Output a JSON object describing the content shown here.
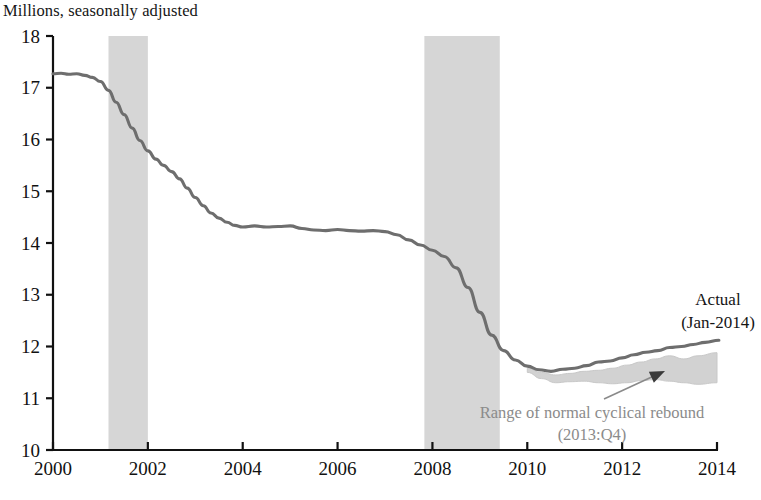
{
  "chart_data": {
    "type": "line",
    "title": "Millions, seasonally adjusted",
    "xlabel": "",
    "ylabel": "",
    "xlim": [
      2000.0,
      2014.0
    ],
    "ylim": [
      10,
      18
    ],
    "grid": false,
    "legend": "none",
    "y_ticks": [
      "18",
      "17",
      "16",
      "15",
      "14",
      "13",
      "12",
      "11",
      "10"
    ],
    "y_tick_values": [
      18,
      17,
      16,
      15,
      14,
      13,
      12,
      11,
      10
    ],
    "x_ticks": [
      "2000",
      "2002",
      "2004",
      "2006",
      "2008",
      "2010",
      "2012",
      "2014"
    ],
    "x_tick_values": [
      2000,
      2002,
      2004,
      2006,
      2008,
      2010,
      2012,
      2014
    ],
    "series": [
      {
        "name": "Actual",
        "color": "#6e6e6e",
        "x": [
          2000.0,
          2000.17,
          2000.33,
          2000.5,
          2000.67,
          2000.83,
          2001.0,
          2001.17,
          2001.33,
          2001.5,
          2001.67,
          2001.83,
          2002.0,
          2002.17,
          2002.33,
          2002.5,
          2002.67,
          2002.83,
          2003.0,
          2003.17,
          2003.33,
          2003.5,
          2003.67,
          2003.83,
          2004.0,
          2004.25,
          2004.5,
          2004.75,
          2005.0,
          2005.25,
          2005.5,
          2005.75,
          2006.0,
          2006.25,
          2006.5,
          2006.75,
          2007.0,
          2007.25,
          2007.5,
          2007.75,
          2008.0,
          2008.25,
          2008.5,
          2008.75,
          2009.0,
          2009.25,
          2009.5,
          2009.75,
          2010.0,
          2010.25,
          2010.5,
          2010.75,
          2011.0,
          2011.25,
          2011.5,
          2011.75,
          2012.0,
          2012.25,
          2012.5,
          2012.75,
          2013.0,
          2013.25,
          2013.5,
          2013.75,
          2014.04
        ],
        "y": [
          17.27,
          17.28,
          17.26,
          17.27,
          17.24,
          17.2,
          17.12,
          16.95,
          16.72,
          16.48,
          16.22,
          15.98,
          15.78,
          15.62,
          15.5,
          15.38,
          15.24,
          15.06,
          14.88,
          14.72,
          14.58,
          14.48,
          14.4,
          14.34,
          14.31,
          14.33,
          14.31,
          14.32,
          14.33,
          14.28,
          14.25,
          14.24,
          14.26,
          14.24,
          14.23,
          14.24,
          14.22,
          14.16,
          14.06,
          13.96,
          13.86,
          13.74,
          13.52,
          13.14,
          12.66,
          12.22,
          11.92,
          11.74,
          11.62,
          11.55,
          11.52,
          11.56,
          11.58,
          11.63,
          11.7,
          11.72,
          11.78,
          11.84,
          11.89,
          11.92,
          11.98,
          12.0,
          12.04,
          12.08,
          12.12
        ]
      }
    ],
    "band": {
      "name": "Range of normal cyclical rebound",
      "color": "#d0d0d0",
      "x": [
        2010.0,
        2010.3,
        2010.6,
        2010.9,
        2011.2,
        2011.5,
        2011.8,
        2012.1,
        2012.4,
        2012.7,
        2013.0,
        2013.3,
        2013.6,
        2014.0
      ],
      "y_low": [
        11.5,
        11.38,
        11.3,
        11.32,
        11.33,
        11.3,
        11.28,
        11.3,
        11.34,
        11.36,
        11.33,
        11.3,
        11.27,
        11.3
      ],
      "y_high": [
        11.58,
        11.5,
        11.45,
        11.48,
        11.52,
        11.54,
        11.58,
        11.64,
        11.7,
        11.76,
        11.82,
        11.76,
        11.82,
        11.88
      ]
    },
    "recessions": [
      {
        "name": "recession-2001",
        "start": 2001.17,
        "end": 2002.0,
        "color": "#d6d6d6"
      },
      {
        "name": "recession-2008",
        "start": 2007.83,
        "end": 2009.42,
        "color": "#d6d6d6"
      }
    ],
    "annotations": [
      {
        "name": "actual-label-line1",
        "text": "Actual",
        "x": 718,
        "y": 305
      },
      {
        "name": "actual-label-line2",
        "text": "(Jan-2014)",
        "x": 718,
        "y": 328
      },
      {
        "name": "range-label-line1",
        "text": "Range of normal cyclical rebound",
        "x": 592,
        "y": 418
      },
      {
        "name": "range-label-line2",
        "text": "(2013:Q4)",
        "x": 592,
        "y": 440
      }
    ],
    "arrow": {
      "name": "range-callout-arrow",
      "x1": 604,
      "y1": 399,
      "x2": 665,
      "y2": 371,
      "color": "#8a8a8a"
    }
  }
}
